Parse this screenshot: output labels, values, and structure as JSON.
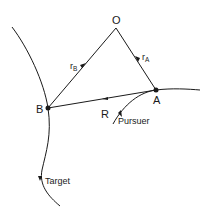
{
  "diagram": {
    "points": {
      "origin": "O",
      "pursuer_point": "A",
      "target_point": "B"
    },
    "vectors": {
      "r_b": {
        "main": "r",
        "sub": "B"
      },
      "r_a": {
        "main": "r",
        "sub": "A"
      },
      "relative": "R"
    },
    "curves": {
      "target": "Target",
      "pursuer": "Pursuer"
    },
    "colors": {
      "ink": "#1a1a1a",
      "background": "#ffffff"
    }
  }
}
